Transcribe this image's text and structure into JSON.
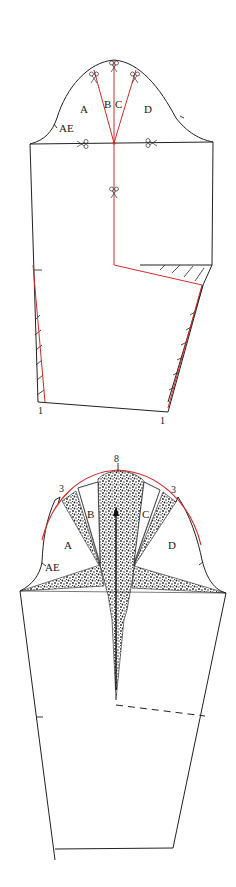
{
  "figure": {
    "type": "sleeve-pattern-slash-and-spread",
    "colors": {
      "outline": "#222222",
      "red_line": "#d42a2a",
      "stipple": "#333333",
      "background": "#ffffff"
    }
  },
  "top_diagram": {
    "panel_labels": {
      "a": "A",
      "b": "B",
      "c": "C",
      "d": "D",
      "ae": "AE"
    },
    "hem_marks": {
      "left": "1",
      "right": "1"
    },
    "scissors_icons": 6
  },
  "bottom_diagram": {
    "panel_labels": {
      "a": "A",
      "b": "B",
      "c": "C",
      "d": "D",
      "ae": "AE"
    },
    "spread_marks": {
      "top": "8",
      "left": "3",
      "right": "3"
    }
  }
}
